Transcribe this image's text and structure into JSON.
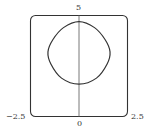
{
  "chart_data": {
    "type": "line",
    "title": "",
    "xlabel": "",
    "ylabel": "",
    "xlim": [
      -2.5,
      2.5
    ],
    "ylim": [
      0,
      5
    ],
    "grid": false,
    "legend": null,
    "tick_labels": {
      "x_left": "−2.5",
      "x_right": "2.5",
      "x_center": "0",
      "y_top": "5"
    },
    "series": [
      {
        "name": "closed curve",
        "description": "rounded-diamond closed curve, symmetric about x=0",
        "points": [
          [
            0,
            4.7
          ],
          [
            0.8,
            4.4
          ],
          [
            1.35,
            3.8
          ],
          [
            1.6,
            3.2
          ],
          [
            1.45,
            2.6
          ],
          [
            0.9,
            1.9
          ],
          [
            0,
            1.6
          ],
          [
            -0.9,
            1.9
          ],
          [
            -1.45,
            2.6
          ],
          [
            -1.6,
            3.2
          ],
          [
            -1.35,
            3.8
          ],
          [
            -0.8,
            4.4
          ],
          [
            0,
            4.7
          ]
        ]
      }
    ]
  }
}
